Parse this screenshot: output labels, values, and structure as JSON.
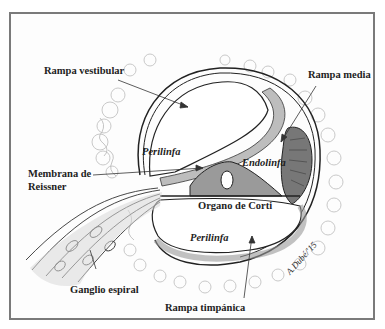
{
  "figure": {
    "labels": {
      "rampa_vestibular": "Rampa vestibular",
      "rampa_media": "Rampa media",
      "membrana_reissner_line1": "Membrana de",
      "membrana_reissner_line2": "Reissner",
      "ganglio_espiral": "Ganglio espiral",
      "rampa_timpanica": "Rampa timpánica",
      "organo_corti": "Organo de Corti",
      "endolinfa": "Endolinfa",
      "perilinfa_upper": "Perilinfa",
      "perilinfa_lower": "Perilinfa"
    },
    "signature": "A.Dubé/'15",
    "colors": {
      "frame": "#7a7a7a",
      "ink": "#1e1e1e",
      "bone": "#c8c8c8",
      "membrane": "#9a9a9a"
    }
  }
}
